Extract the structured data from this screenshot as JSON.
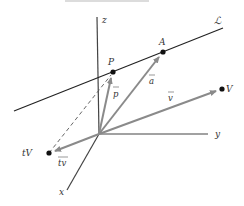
{
  "figure": {
    "colors": {
      "axis": "#444444",
      "line": "#222222",
      "vector": "#8a8a8a",
      "point": "#111111",
      "dashed": "#555555",
      "background": "#ffffff"
    },
    "axes": {
      "z": {
        "label": "z"
      },
      "y": {
        "label": "y"
      },
      "x": {
        "label": "x"
      }
    },
    "line": {
      "label": "ℒ"
    },
    "points": {
      "P": {
        "label": "P"
      },
      "A": {
        "label": "A"
      },
      "V": {
        "label": "V"
      },
      "tV": {
        "label": "tV"
      }
    },
    "vectors": {
      "p": {
        "label": "p"
      },
      "a": {
        "label": "a"
      },
      "v": {
        "label": "v"
      },
      "tv": {
        "label": "tv"
      }
    }
  }
}
